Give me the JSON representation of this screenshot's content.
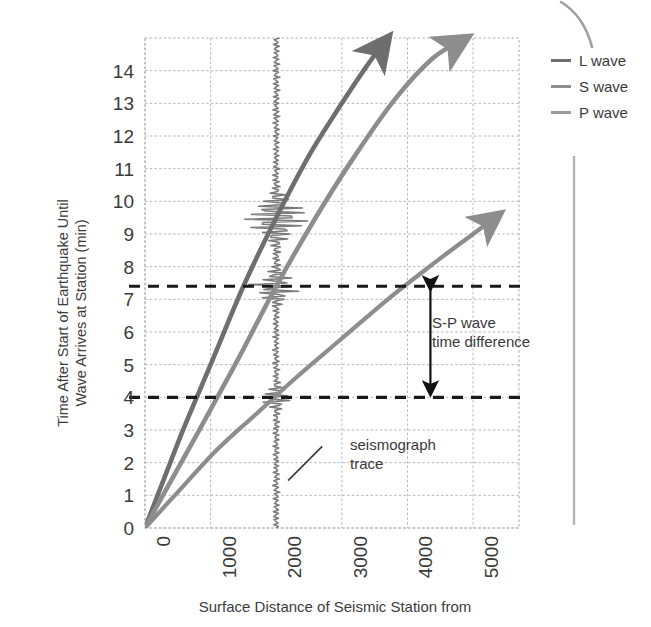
{
  "chart_data": {
    "type": "line",
    "title": "",
    "xlabel": "Surface Distance of Seismic Station from",
    "ylabel": "Time After Start of Earthquake Until Wave Arrives at Station (min)",
    "ylabel_line1": "Time After Start of Earthquake Until",
    "ylabel_line2": "Wave Arrives at Station (min)",
    "xlim": [
      0,
      5700
    ],
    "ylim": [
      0,
      15
    ],
    "grid": true,
    "x_ticks": [
      0,
      1000,
      2000,
      3000,
      4000,
      5000
    ],
    "x_tick_labels": [
      "0",
      "1000",
      "2000",
      "3000",
      "4000",
      "5000"
    ],
    "y_ticks": [
      0,
      1,
      2,
      3,
      4,
      5,
      6,
      7,
      8,
      9,
      10,
      11,
      12,
      13,
      14
    ],
    "y_tick_labels": [
      "0",
      "1",
      "2",
      "3",
      "4",
      "5",
      "6",
      "7",
      "8",
      "9",
      "10",
      "11",
      "12",
      "13",
      "14"
    ],
    "legend_position": "right",
    "series": [
      {
        "name": "L wave",
        "color": "#6e6e6e",
        "points": [
          [
            0,
            0
          ],
          [
            250,
            1.3
          ],
          [
            600,
            3.1
          ],
          [
            1000,
            5.0
          ],
          [
            1500,
            7.4
          ],
          [
            2000,
            9.5
          ],
          [
            2500,
            11.4
          ],
          [
            3000,
            13.0
          ],
          [
            3400,
            14.2
          ],
          [
            3700,
            15.0
          ]
        ],
        "arrow_tip": [
          3700,
          15.0
        ]
      },
      {
        "name": "S wave",
        "color": "#8d8d8d",
        "points": [
          [
            0,
            0
          ],
          [
            300,
            1.1
          ],
          [
            800,
            2.9
          ],
          [
            1400,
            5.1
          ],
          [
            2000,
            7.4
          ],
          [
            2600,
            9.5
          ],
          [
            3200,
            11.4
          ],
          [
            3800,
            13.1
          ],
          [
            4400,
            14.4
          ],
          [
            4900,
            15.0
          ]
        ],
        "arrow_tip": [
          4900,
          15.0
        ]
      },
      {
        "name": "P wave",
        "color": "#8d8d8d",
        "points": [
          [
            0,
            0
          ],
          [
            500,
            1.1
          ],
          [
            1100,
            2.4
          ],
          [
            1700,
            3.5
          ],
          [
            2300,
            4.6
          ],
          [
            3000,
            5.8
          ],
          [
            3700,
            7.0
          ],
          [
            4400,
            8.1
          ],
          [
            5000,
            9.0
          ],
          [
            5400,
            9.6
          ]
        ],
        "arrow_tip": [
          5400,
          9.6
        ]
      }
    ],
    "reference_lines": [
      {
        "name": "s-wave-arrival",
        "y": 7.4,
        "style": "dashed",
        "color": "#1a1a1a"
      },
      {
        "name": "p-wave-arrival",
        "y": 4.0,
        "style": "dashed",
        "color": "#1a1a1a"
      }
    ],
    "annotations": [
      {
        "name": "s-p-wave-time-difference",
        "line1": "S-P wave",
        "line2": "time difference",
        "arrow_x": 4350,
        "arrow_y_top": 7.4,
        "arrow_y_bottom": 4.0
      },
      {
        "name": "seismograph-trace",
        "line1": "seismograph",
        "line2": "trace",
        "leader_from": [
          2180,
          1.45
        ],
        "leader_to": [
          2700,
          2.5
        ]
      }
    ],
    "seismograph_trace": {
      "name": "seismograph trace",
      "x_km": 2000,
      "color": "#7a7a7a",
      "burst_times": [
        9.5,
        7.4,
        4.0
      ],
      "description": "vertical wiggle trace at 2000 km with amplitude bursts at L, S and P wave arrivals"
    }
  },
  "legend": {
    "items": [
      {
        "label": "L wave",
        "color": "#6e6e6e"
      },
      {
        "label": "S wave",
        "color": "#8d8d8d"
      },
      {
        "label": "P wave",
        "color": "#9b9b9b"
      }
    ]
  },
  "colors": {
    "background": "#ffffff",
    "grid": "#b8b8c0",
    "axis_text": "#3a3a3a",
    "dashed_reference": "#1a1a1a",
    "l_wave": "#6e6e6e",
    "s_wave": "#8d8d8d",
    "p_wave": "#9b9b9b",
    "page_rule": "#b0b0b0"
  }
}
